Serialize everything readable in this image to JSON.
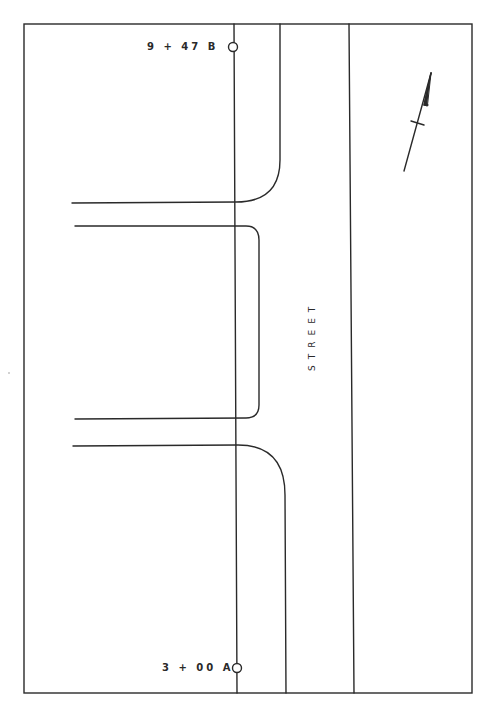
{
  "drawing": {
    "type": "street plan / driveway layout",
    "street_label": "STREET",
    "stations": {
      "top": {
        "label": "9 + 47 B"
      },
      "bottom": {
        "label": "3 + 00 A"
      }
    },
    "north_arrow": {
      "icon": "north-arrow-icon"
    },
    "line_color": "#2a2a2a",
    "background": "#ffffff"
  }
}
